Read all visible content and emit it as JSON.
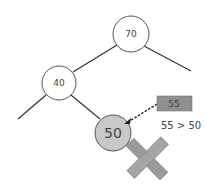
{
  "diagram": {
    "nodes": [
      {
        "id": "n70",
        "label": "70",
        "cx": 131,
        "cy": 34,
        "r": 18,
        "fill": "#ffffff",
        "font": 9
      },
      {
        "id": "n40",
        "label": "40",
        "cx": 59,
        "cy": 83,
        "r": 17,
        "fill": "#ffffff",
        "font": 9
      },
      {
        "id": "n50",
        "label": "50",
        "cx": 113,
        "cy": 133,
        "r": 18,
        "fill": "#c8c8c8",
        "font": 14
      }
    ],
    "new_key": {
      "label": "55",
      "color": "#8f8f8f"
    },
    "comparison": "55 > 50",
    "colors": {
      "edge": "#333333",
      "x_mark": "#9a9a9a"
    }
  }
}
